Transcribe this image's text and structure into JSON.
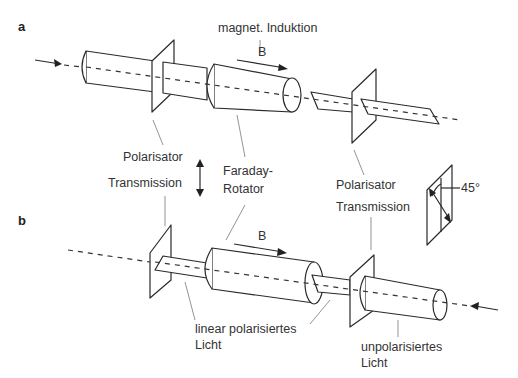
{
  "panels": {
    "a": {
      "label": "a"
    },
    "b": {
      "label": "b"
    }
  },
  "labels": {
    "magnetic_induction": "magnet. Induktion",
    "b_field_a": "B",
    "b_field_b": "B",
    "polarizer_left": "Polarisator",
    "transmission_left": "Transmission",
    "faraday_line1": "Faraday-",
    "faraday_line2": "Rotator",
    "polarizer_right": "Polarisator",
    "transmission_right": "Transmission",
    "angle": "45°",
    "linear_line1": "linear polarisiertes",
    "linear_line2": "Licht",
    "unpolarized_line1": "unpolarisiertes",
    "unpolarized_line2": "Licht"
  }
}
